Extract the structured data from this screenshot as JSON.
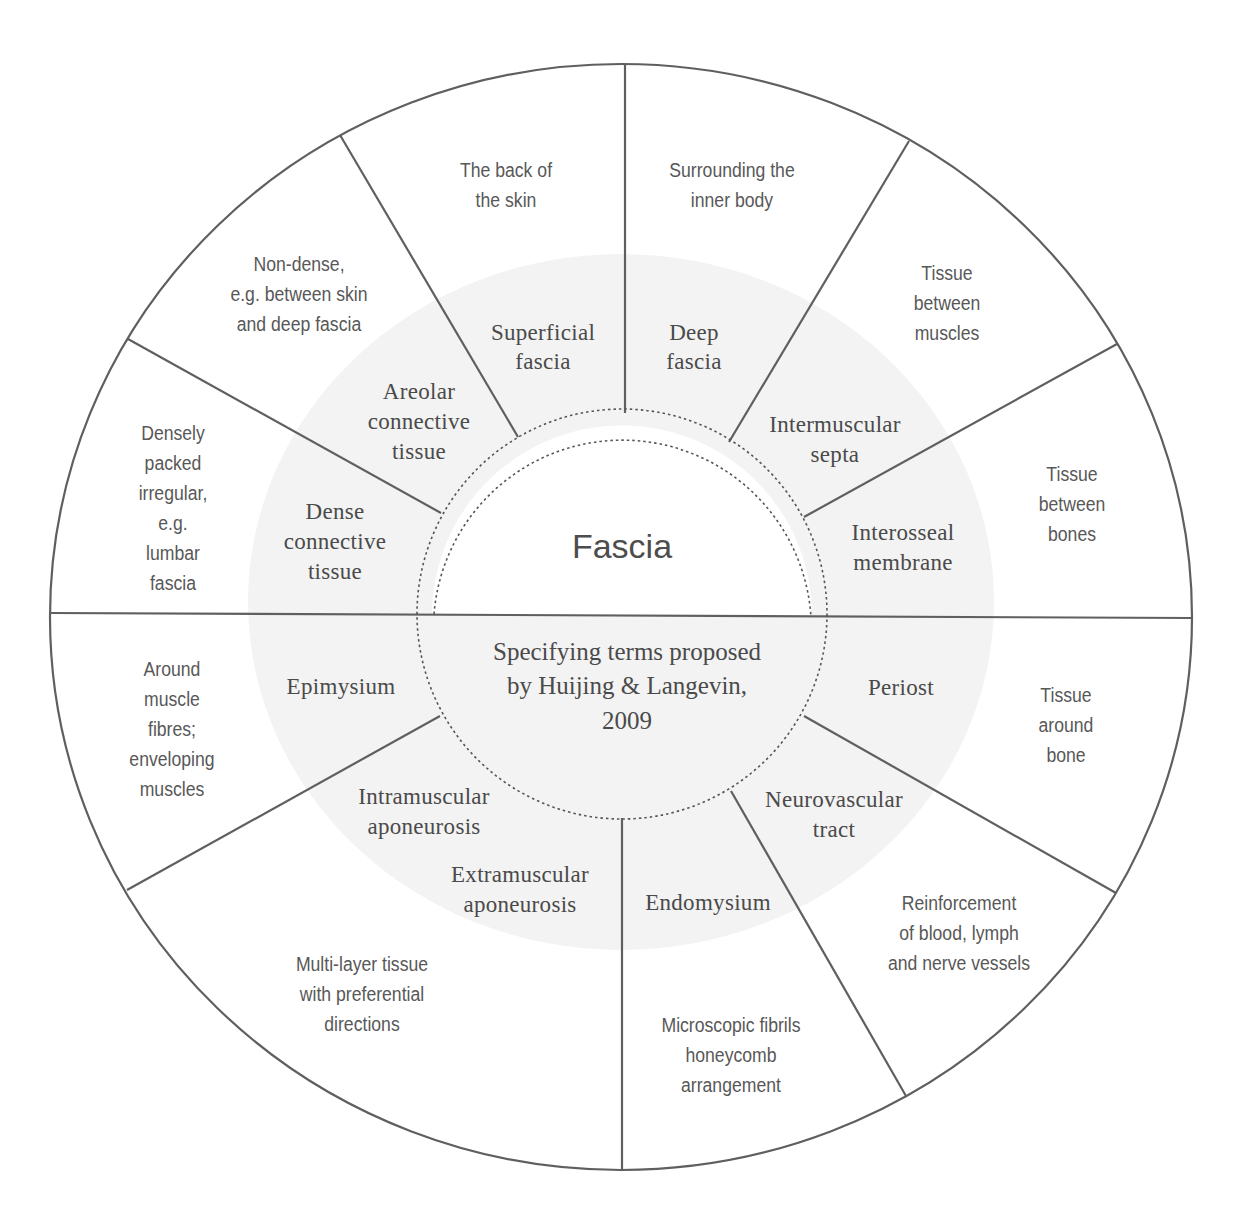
{
  "diagram": {
    "center": {
      "title": "Fascia",
      "subtitle_lines": [
        "Specifying terms proposed",
        "by Huijing & Langevin,",
        "2009"
      ]
    },
    "terms": [
      {
        "id": "superficial-fascia",
        "lines": [
          "Superficial",
          "fascia"
        ]
      },
      {
        "id": "deep-fascia",
        "lines": [
          "Deep",
          "fascia"
        ]
      },
      {
        "id": "intermuscular-septa",
        "lines": [
          "Intermuscular",
          "septa"
        ]
      },
      {
        "id": "interosseal-membrane",
        "lines": [
          "Interosseal",
          "membrane"
        ]
      },
      {
        "id": "periost",
        "lines": [
          "Periost"
        ]
      },
      {
        "id": "neurovascular-tract",
        "lines": [
          "Neurovascular",
          "tract"
        ]
      },
      {
        "id": "endomysium",
        "lines": [
          "Endomysium"
        ]
      },
      {
        "id": "extramuscular-aponeurosis",
        "lines": [
          "Extramuscular",
          "aponeurosis"
        ]
      },
      {
        "id": "intramuscular-aponeurosis",
        "lines": [
          "Intramuscular",
          "aponeurosis"
        ]
      },
      {
        "id": "epimysium",
        "lines": [
          "Epimysium"
        ]
      },
      {
        "id": "dense-connective-tissue",
        "lines": [
          "Dense",
          "connective",
          "tissue"
        ]
      },
      {
        "id": "areolar-connective-tissue",
        "lines": [
          "Areolar",
          "connective",
          "tissue"
        ]
      }
    ],
    "descriptions": [
      {
        "id": "back-of-skin",
        "lines": [
          "The back of",
          "the skin"
        ]
      },
      {
        "id": "surrounding-inner-body",
        "lines": [
          "Surrounding the",
          "inner body"
        ]
      },
      {
        "id": "tissue-between-muscles",
        "lines": [
          "Tissue",
          "between",
          "muscles"
        ]
      },
      {
        "id": "tissue-between-bones",
        "lines": [
          "Tissue",
          "between",
          "bones"
        ]
      },
      {
        "id": "tissue-around-bone",
        "lines": [
          "Tissue",
          "around",
          "bone"
        ]
      },
      {
        "id": "reinforcement-vessels",
        "lines": [
          "Reinforcement",
          "of blood, lymph",
          "and nerve vessels"
        ]
      },
      {
        "id": "microscopic-fibrils",
        "lines": [
          "Microscopic fibrils",
          "honeycomb",
          "arrangement"
        ]
      },
      {
        "id": "multi-layer-tissue",
        "lines": [
          "Multi-layer tissue",
          "with preferential",
          "directions"
        ]
      },
      {
        "id": "around-muscle-fibres",
        "lines": [
          "Around",
          "muscle",
          "fibres;",
          "enveloping",
          "muscles"
        ]
      },
      {
        "id": "densely-packed",
        "lines": [
          "Densely",
          "packed",
          "irregular,",
          "e.g.",
          "lumbar",
          "fascia"
        ]
      },
      {
        "id": "non-dense",
        "lines": [
          "Non-dense,",
          "e.g. between skin",
          "and deep fascia"
        ]
      }
    ],
    "colors": {
      "line": "#5f5f5f",
      "inner_disc": "#f3f3f3",
      "center_fill": "#ffffff",
      "text": "#555555"
    }
  }
}
